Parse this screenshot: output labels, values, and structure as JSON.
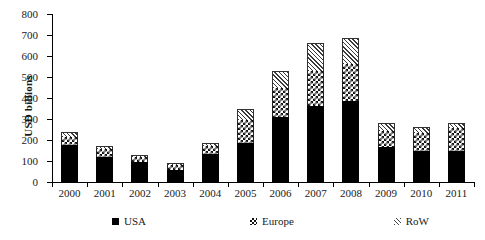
{
  "chart_data": {
    "type": "bar",
    "stacked": true,
    "title": "",
    "xlabel": "",
    "ylabel": "USD billions",
    "ylim": [
      0,
      800
    ],
    "ytick_step": 100,
    "yticks": [
      0,
      100,
      200,
      300,
      400,
      500,
      600,
      700,
      800
    ],
    "grid": false,
    "legend_position": "bottom",
    "categories": [
      "2000",
      "2001",
      "2002",
      "2003",
      "2004",
      "2005",
      "2006",
      "2007",
      "2008",
      "2009",
      "2010",
      "2011"
    ],
    "series": [
      {
        "name": "USA",
        "pattern": "solid-black",
        "color": "#000000",
        "values": [
          175,
          120,
          95,
          55,
          135,
          185,
          310,
          360,
          385,
          165,
          150,
          150
        ]
      },
      {
        "name": "Europe",
        "pattern": "checkerboard",
        "color": "#111111",
        "values": [
          40,
          35,
          25,
          25,
          35,
          110,
          140,
          170,
          175,
          80,
          85,
          105
        ]
      },
      {
        "name": "RoW",
        "pattern": "diagonal-hatch",
        "color": "#3a3a3a",
        "values": [
          25,
          15,
          10,
          10,
          15,
          55,
          80,
          130,
          125,
          35,
          25,
          25
        ]
      }
    ],
    "totals": [
      240,
      170,
      130,
      90,
      185,
      350,
      530,
      660,
      685,
      280,
      260,
      280
    ]
  },
  "legend": {
    "items": [
      {
        "label": "USA",
        "swatch": "solid-black-square-icon"
      },
      {
        "label": "Europe",
        "swatch": "checkerboard-square-icon"
      },
      {
        "label": "RoW",
        "swatch": "hatched-square-icon"
      }
    ]
  }
}
